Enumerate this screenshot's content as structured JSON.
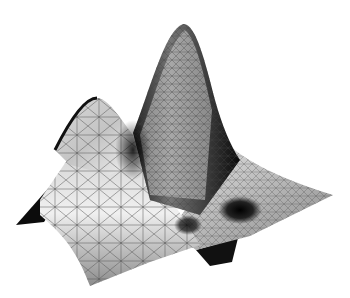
{
  "image": {
    "description": "3D rendered triangulated mesh surface with two peaks and a valley, grayscale shading",
    "background_color": "#ffffff",
    "surface": {
      "shading": "grayscale",
      "mesh": "triangulated wireframe overlay",
      "features": [
        {
          "name": "left-peak",
          "apex": [
            95,
            98
          ]
        },
        {
          "name": "tall-peak",
          "apex": [
            187,
            24
          ]
        },
        {
          "name": "saddle",
          "point": [
            133,
            133
          ]
        },
        {
          "name": "valley-pit",
          "point": [
            240,
            205
          ]
        },
        {
          "name": "underside-flap",
          "point": [
            218,
            258
          ]
        },
        {
          "name": "left-flap",
          "point": [
            16,
            225
          ]
        },
        {
          "name": "right-tip",
          "point": [
            333,
            195
          ]
        }
      ],
      "colors": {
        "highlight": "#f2f2f2",
        "midtone": "#9a9a9a",
        "shadow": "#111111",
        "mesh_line": "#555555"
      }
    }
  }
}
